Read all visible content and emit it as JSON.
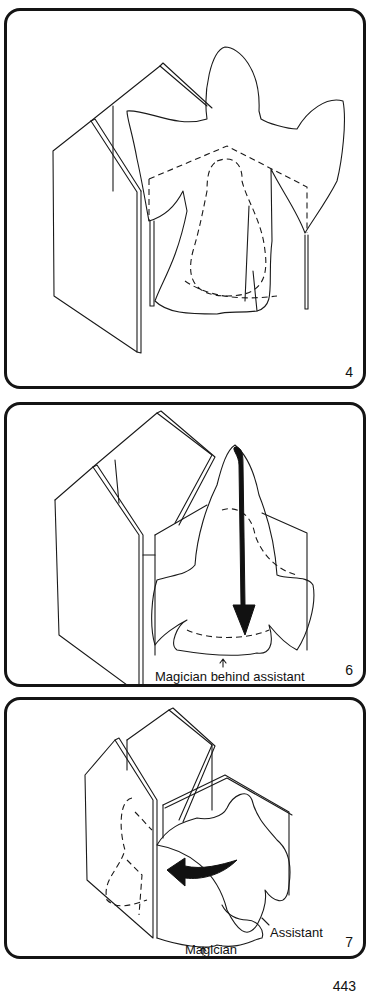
{
  "panels": [
    {
      "number": "4",
      "caption": ""
    },
    {
      "number": "6",
      "caption": "Magician behind assistant"
    },
    {
      "number": "7",
      "labels": {
        "assistant": "Assistant",
        "magician": "Magician"
      }
    }
  ],
  "page_number": "443",
  "colors": {
    "ink": "#141414",
    "paper": "#ffffff"
  }
}
